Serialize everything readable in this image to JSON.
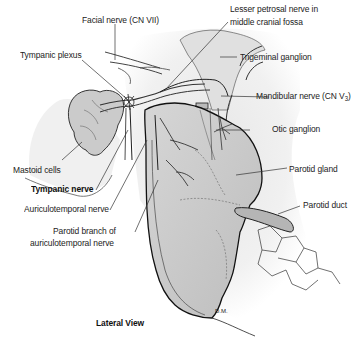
{
  "figure": {
    "view_title": "Lateral View",
    "signature": "D.M.",
    "labels": {
      "facial_nerve": "Facial nerve (CN VII)",
      "lesser_petrosal_line1": "Lesser petrosal nerve in",
      "lesser_petrosal_line2": "middle cranial fossa",
      "tympanic_plexus": "Tympanic plexus",
      "trigeminal_ganglion": "Trigeminal ganglion",
      "mandibular_nerve_prefix": "Mandibular nerve (CN V",
      "mandibular_nerve_sub": "3",
      "mandibular_nerve_suffix": ")",
      "otic_ganglion": "Otic ganglion",
      "mastoid_cells": "Mastoid cells",
      "tympanic_nerve": "Tympanic nerve",
      "parotid_gland": "Parotid gland",
      "auriculotemporal_nerve": "Auriculotemporal nerve",
      "parotid_duct": "Parotid duct",
      "parotid_branch_line1": "Parotid branch of",
      "parotid_branch_line2": "auriculotemporal nerve"
    },
    "colors": {
      "background": "#ffffff",
      "gland_fill": "#cfcfcf",
      "gland_shade": "#b8b8b8",
      "bone_fill": "#e4e4e4",
      "outline": "#1a1a1a",
      "leader": "#333333"
    }
  }
}
